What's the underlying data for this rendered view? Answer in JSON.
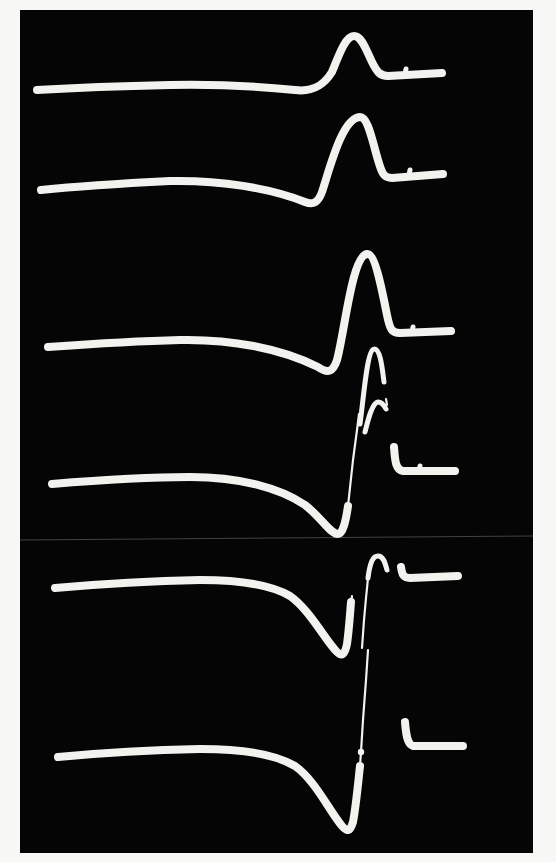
{
  "photo": {
    "description": "Photograph of six stacked oscilloscope sweeps showing biphasic waveforms on a black screen",
    "colors": {
      "paper": "#f7f7f5",
      "screen": "#050505",
      "trace": "#f2f2ee",
      "scan_line": "#6a6a6a"
    },
    "screen_rect": {
      "x": 20,
      "y": 10,
      "width": 513,
      "height": 843
    },
    "scan_line": {
      "x1": 20,
      "y1": 540,
      "x2": 533,
      "y2": 536
    },
    "traces": [
      {
        "id": "trace-1",
        "segments": [
          {
            "weight": "thick",
            "d": "M37,90 C70,88 120,86 170,85 C220,84 265,87 295,90 C310,92 322,88 332,72 C340,52 346,36 354,36 C362,36 366,50 372,62 C377,72 380,76 388,76 L442,73"
          },
          {
            "weight": "mid",
            "d": "M405,74 L406,69"
          }
        ]
      },
      {
        "id": "trace-2",
        "segments": [
          {
            "weight": "thick",
            "d": "M41,190 C80,186 130,183 170,181 C220,180 270,188 305,202 C313,205 318,203 322,192 C330,168 342,118 360,117 C368,117 372,140 378,160 C382,174 384,178 392,178 L443,174"
          },
          {
            "weight": "mid",
            "d": "M409,175 L410,170"
          }
        ]
      },
      {
        "id": "trace-3",
        "segments": [
          {
            "weight": "thick",
            "d": "M48,347 C90,344 140,341 180,340 C230,339 280,348 318,367 C328,374 333,372 337,360 C345,330 352,256 367,254 C375,253 382,290 387,315 C390,330 392,333 400,333 L451,331"
          },
          {
            "weight": "mid",
            "d": "M412,332 L413,327"
          }
        ]
      },
      {
        "id": "trace-4",
        "segments": [
          {
            "weight": "thick",
            "d": "M52,484 C100,480 150,477 190,477 C240,477 280,488 305,505 C322,518 330,534 338,534 C343,534 346,520 348,506"
          },
          {
            "weight": "thin",
            "d": "M348,506 L353,460 L357,430 L359,414"
          },
          {
            "weight": "mid",
            "d": "M360,424 C364,395 367,350 374,349 C380,348 382,366 384,382"
          },
          {
            "weight": "mid",
            "d": "M365,432 C368,420 372,403 378,402 C382,402 384,405 386,409"
          },
          {
            "weight": "thin",
            "d": "M386,399 L387,405"
          },
          {
            "weight": "thick",
            "d": "M394,447 C395,462 396,470 403,471 L455,471"
          },
          {
            "weight": "mid",
            "d": "M419,470 L420,466"
          }
        ]
      },
      {
        "id": "trace-5",
        "segments": [
          {
            "weight": "thick",
            "d": "M55,588 C100,584 150,581 200,580 C240,580 270,584 290,596 C310,610 325,640 337,652 C342,657 345,654 347,644 C349,630 350,614 351,602"
          },
          {
            "weight": "thin",
            "d": "M351,602 L352,596"
          },
          {
            "weight": "thin",
            "d": "M362,648 L364,620 L366,598 L368,578"
          },
          {
            "weight": "mid",
            "d": "M368,578 C370,562 373,556 378,556 C383,556 385,562 387,570"
          },
          {
            "weight": "thick",
            "d": "M401,567 C402,574 403,578 410,578 L458,576"
          }
        ]
      },
      {
        "id": "trace-6",
        "segments": [
          {
            "weight": "thick",
            "d": "M58,757 C100,753 150,750 200,749 C245,749 275,754 295,766 C315,780 330,812 342,826 C347,832 350,832 353,822 C356,806 358,784 360,766"
          },
          {
            "weight": "thin",
            "d": "M360,766 L361,752 L363,720 L366,680 L368,650"
          },
          {
            "weight": "dot",
            "cx": 361,
            "cy": 752,
            "r": 3.2
          },
          {
            "weight": "thick",
            "d": "M405,722 C406,734 407,744 413,746 L463,746"
          }
        ]
      }
    ]
  }
}
